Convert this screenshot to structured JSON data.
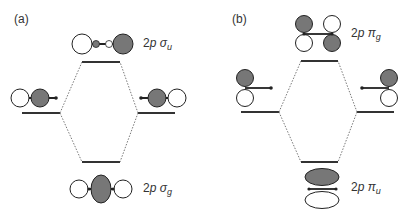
{
  "panels": [
    {
      "label": "(a)",
      "upper_orbital": {
        "prefix": "2",
        "p": "p",
        "symbol": "σ",
        "sub": "u"
      },
      "lower_orbital": {
        "prefix": "2",
        "p": "p",
        "symbol": "σ",
        "sub": "g"
      }
    },
    {
      "label": "(b)",
      "upper_orbital": {
        "prefix": "2",
        "p": "p",
        "symbol": "π",
        "sub": "g"
      },
      "lower_orbital": {
        "prefix": "2",
        "p": "p",
        "symbol": "π",
        "sub": "u"
      }
    }
  ],
  "colors": {
    "shaded": "#777777",
    "line": "#333333",
    "outline": "#222222"
  }
}
